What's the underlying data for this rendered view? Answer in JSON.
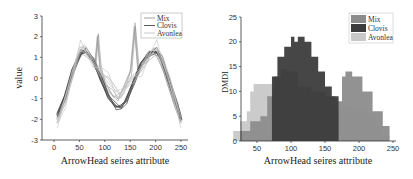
{
  "chart_data": [
    {
      "type": "line",
      "title": "",
      "xlabel": "ArrowHead seires attribute",
      "ylabel": "value",
      "xlim": [
        -25,
        275
      ],
      "ylim": [
        -3,
        3
      ],
      "xticks": [
        "0",
        "50",
        "100",
        "150",
        "200",
        "250"
      ],
      "yticks": [
        "3",
        "2",
        "1",
        "0",
        "-1",
        "-2",
        "-3"
      ],
      "grid": false,
      "legend_position": "upper right",
      "legend": [
        "Mix",
        "Clovis",
        "Avonlea"
      ],
      "series": [
        {
          "name": "Mix",
          "color": "#9a9a9a",
          "x": [
            5,
            20,
            40,
            55,
            70,
            80,
            85,
            90,
            100,
            115,
            125,
            135,
            150,
            158,
            165,
            180,
            195,
            205,
            220,
            235,
            248
          ],
          "values": [
            -2.0,
            -1.0,
            0.5,
            1.3,
            1.0,
            0.6,
            2.0,
            0.5,
            -0.3,
            -0.8,
            -1.0,
            -0.6,
            0.3,
            2.5,
            0.3,
            0.8,
            1.3,
            1.0,
            0.0,
            -1.2,
            -2.0
          ]
        },
        {
          "name": "Clovis",
          "color": "#4a4a4a",
          "x": [
            5,
            20,
            35,
            50,
            60,
            75,
            90,
            105,
            120,
            130,
            140,
            155,
            170,
            185,
            200,
            210,
            225,
            240,
            248
          ],
          "values": [
            -1.8,
            -0.9,
            0.4,
            1.2,
            1.3,
            0.9,
            0.0,
            -0.9,
            -1.4,
            -1.4,
            -1.1,
            -0.2,
            0.7,
            1.2,
            1.3,
            0.9,
            -0.2,
            -1.3,
            -2.0
          ]
        },
        {
          "name": "Avonlea",
          "color": "#c4c4c4",
          "x": [
            5,
            20,
            35,
            50,
            60,
            75,
            90,
            105,
            120,
            130,
            140,
            155,
            170,
            185,
            200,
            210,
            225,
            240,
            248
          ],
          "values": [
            -2.2,
            -1.1,
            0.2,
            1.5,
            1.4,
            0.8,
            0.3,
            0.0,
            -0.6,
            -0.8,
            -0.4,
            0.0,
            0.4,
            1.1,
            1.5,
            1.0,
            0.0,
            -1.4,
            -2.2
          ]
        }
      ]
    },
    {
      "type": "area",
      "title": "",
      "xlabel": "ArrowHead seires attribute",
      "ylabel": "DMDI",
      "xlim": [
        0,
        255
      ],
      "ylim": [
        0,
        25
      ],
      "xticks": [
        "50",
        "100",
        "150",
        "200",
        "250"
      ],
      "yticks": [
        "25",
        "20",
        "15",
        "10",
        "5",
        "0"
      ],
      "grid": false,
      "legend_position": "upper right",
      "legend": [
        "Mix",
        "Clovis",
        "Avonlea"
      ],
      "series": [
        {
          "name": "Avonlea",
          "color": "#c8c8c8",
          "x": [
            5,
            15,
            25,
            35,
            40,
            45,
            60,
            75,
            90,
            110,
            130,
            150,
            170,
            190,
            205,
            215,
            225,
            235,
            245
          ],
          "values": [
            0,
            2,
            4,
            6,
            10,
            11.5,
            11.5,
            10,
            9,
            8.5,
            8,
            7.5,
            7,
            6.5,
            6,
            5,
            3,
            1,
            0
          ]
        },
        {
          "name": "Mix",
          "color": "#8c8c8c",
          "x": [
            10,
            25,
            40,
            55,
            65,
            75,
            85,
            95,
            110,
            130,
            150,
            165,
            175,
            180,
            190,
            205,
            220,
            235,
            245
          ],
          "values": [
            0,
            2,
            4,
            5,
            9,
            13,
            14.5,
            14,
            11,
            10,
            9,
            8,
            13,
            14,
            13,
            10,
            6,
            3,
            0
          ]
        },
        {
          "name": "Clovis",
          "color": "#3c3c3c",
          "x": [
            72,
            80,
            90,
            100,
            105,
            110,
            115,
            120,
            130,
            140,
            150,
            160,
            170
          ],
          "values": [
            13,
            17,
            19,
            21,
            20,
            21,
            21,
            20,
            17,
            14,
            11,
            9,
            7
          ]
        }
      ]
    }
  ]
}
